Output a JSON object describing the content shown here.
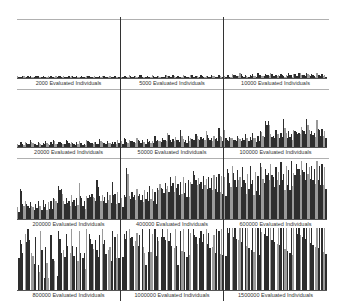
{
  "chart_data": {
    "type": "bar",
    "title": "",
    "layout": "4x3 grid of small-multiple bar plots",
    "grid": false,
    "legend": null,
    "colors": {
      "dark": "#2e2e2e",
      "light": "#9a9a9a",
      "rule": "#b0b0b0",
      "divider": "#333333"
    },
    "panels": [
      {
        "label": "2000 Evaluated Individuals",
        "evaluated": 2000,
        "max_height_frac": 0.04
      },
      {
        "label": "5000 Evaluated Individuals",
        "evaluated": 5000,
        "max_height_frac": 0.06
      },
      {
        "label": "10000 Evaluated Individuals",
        "evaluated": 10000,
        "max_height_frac": 0.09
      },
      {
        "label": "20000 Evaluated Individuals",
        "evaluated": 20000,
        "max_height_frac": 0.14
      },
      {
        "label": "50000 Evaluated Individuals",
        "evaluated": 50000,
        "max_height_frac": 0.33
      },
      {
        "label": "100000 Evaluated Individuals",
        "evaluated": 100000,
        "max_height_frac": 0.5
      },
      {
        "label": "200000 Evaluated Individuals",
        "evaluated": 200000,
        "max_height_frac": 0.65
      },
      {
        "label": "400000 Evaluated Individuals",
        "evaluated": 400000,
        "max_height_frac": 0.85
      },
      {
        "label": "600000 Evaluated Individuals",
        "evaluated": 600000,
        "max_height_frac": 0.97
      },
      {
        "label": "800000 Evaluated Individuals",
        "evaluated": 800000,
        "max_height_frac": 1.0
      },
      {
        "label": "1000000 Evaluated Individuals",
        "evaluated": 1000000,
        "max_height_frac": 1.0
      },
      {
        "label": "1500000 Evaluated Individuals",
        "evaluated": 1500000,
        "max_height_frac": 1.0
      }
    ],
    "series": [
      {
        "name": "2000",
        "values": [
          0.02,
          0.01,
          0.03,
          0.01,
          0.02,
          0.02,
          0.01,
          0.03,
          0.02,
          0.01,
          0.02,
          0.01,
          0.03,
          0.02,
          0.01,
          0.02,
          0.03,
          0.01,
          0.02,
          0.01,
          0.02,
          0.03,
          0.01,
          0.02,
          0.01,
          0.02,
          0.01,
          0.03,
          0.02,
          0.01,
          0.02,
          0.01,
          0.02,
          0.03,
          0.02,
          0.01,
          0.02,
          0.01,
          0.02,
          0.01
        ]
      },
      {
        "name": "5000",
        "values": [
          0.02,
          0.03,
          0.01,
          0.04,
          0.02,
          0.03,
          0.02,
          0.05,
          0.02,
          0.01,
          0.03,
          0.02,
          0.04,
          0.02,
          0.03,
          0.01,
          0.02,
          0.05,
          0.03,
          0.02,
          0.04,
          0.02,
          0.03,
          0.02,
          0.04,
          0.03,
          0.02,
          0.05,
          0.02,
          0.03,
          0.02,
          0.04,
          0.02,
          0.03,
          0.02,
          0.04,
          0.03,
          0.02,
          0.04,
          0.02
        ]
      },
      {
        "name": "10000",
        "values": [
          0.03,
          0.05,
          0.02,
          0.06,
          0.04,
          0.03,
          0.07,
          0.03,
          0.05,
          0.02,
          0.04,
          0.06,
          0.03,
          0.08,
          0.04,
          0.03,
          0.06,
          0.04,
          0.07,
          0.03,
          0.05,
          0.04,
          0.06,
          0.03,
          0.05,
          0.07,
          0.04,
          0.06,
          0.03,
          0.08,
          0.05,
          0.04,
          0.07,
          0.04,
          0.06,
          0.03,
          0.08,
          0.05,
          0.06,
          0.04
        ]
      },
      {
        "name": "20000",
        "values": [
          0.05,
          0.08,
          0.04,
          0.07,
          0.05,
          0.1,
          0.06,
          0.04,
          0.08,
          0.05,
          0.06,
          0.09,
          0.05,
          0.07,
          0.1,
          0.05,
          0.08,
          0.06,
          0.05,
          0.11,
          0.06,
          0.08,
          0.05,
          0.07,
          0.09,
          0.06,
          0.05,
          0.1,
          0.07,
          0.06,
          0.08,
          0.05,
          0.12,
          0.07,
          0.06,
          0.09,
          0.06,
          0.08,
          0.07,
          0.1
        ]
      },
      {
        "name": "50000",
        "values": [
          0.1,
          0.15,
          0.08,
          0.12,
          0.1,
          0.09,
          0.16,
          0.1,
          0.12,
          0.08,
          0.14,
          0.1,
          0.11,
          0.2,
          0.12,
          0.1,
          0.15,
          0.13,
          0.25,
          0.12,
          0.14,
          0.18,
          0.12,
          0.3,
          0.14,
          0.12,
          0.2,
          0.15,
          0.13,
          0.22,
          0.14,
          0.18,
          0.15,
          0.28,
          0.16,
          0.15,
          0.2,
          0.16,
          0.33,
          0.18
        ]
      },
      {
        "name": "100000",
        "values": [
          0.3,
          0.12,
          0.18,
          0.15,
          0.12,
          0.2,
          0.14,
          0.16,
          0.22,
          0.15,
          0.18,
          0.25,
          0.16,
          0.2,
          0.28,
          0.2,
          0.45,
          0.45,
          0.22,
          0.2,
          0.3,
          0.22,
          0.25,
          0.5,
          0.24,
          0.28,
          0.22,
          0.3,
          0.26,
          0.25,
          0.35,
          0.28,
          0.5,
          0.3,
          0.28,
          0.25,
          0.48,
          0.3,
          0.32,
          0.28
        ]
      },
      {
        "name": "200000",
        "values": [
          0.2,
          0.5,
          0.25,
          0.3,
          0.22,
          0.28,
          0.2,
          0.25,
          0.3,
          0.22,
          0.32,
          0.25,
          0.28,
          0.3,
          0.35,
          0.3,
          0.55,
          0.5,
          0.3,
          0.35,
          0.3,
          0.4,
          0.32,
          0.35,
          0.6,
          0.35,
          0.3,
          0.38,
          0.4,
          0.42,
          0.35,
          0.65,
          0.38,
          0.4,
          0.36,
          0.45,
          0.4,
          0.62,
          0.42,
          0.45
        ]
      },
      {
        "name": "400000",
        "values": [
          0.35,
          0.4,
          0.85,
          0.38,
          0.45,
          0.4,
          0.5,
          0.42,
          0.4,
          0.48,
          0.45,
          0.55,
          0.5,
          0.45,
          0.52,
          0.58,
          0.5,
          0.6,
          0.55,
          0.7,
          0.6,
          0.72,
          0.58,
          0.62,
          0.7,
          0.6,
          0.65,
          0.62,
          0.8,
          0.65,
          0.68,
          0.62,
          0.72,
          0.66,
          0.7,
          0.68,
          0.74,
          0.7,
          0.75,
          0.72
        ]
      },
      {
        "name": "600000",
        "values": [
          0.7,
          0.85,
          0.6,
          0.9,
          0.65,
          0.82,
          0.7,
          0.88,
          0.6,
          0.75,
          0.9,
          0.65,
          0.8,
          0.72,
          0.95,
          0.68,
          0.85,
          0.78,
          0.92,
          0.7,
          0.88,
          0.8,
          0.96,
          0.75,
          0.9,
          0.82,
          0.97,
          0.78,
          0.92,
          0.85,
          0.98,
          0.8,
          0.95,
          0.88,
          0.9,
          0.85,
          0.97,
          0.9,
          0.93,
          0.88
        ]
      },
      {
        "name": "800000",
        "values": [
          0.95,
          0.8,
          0.6,
          0.9,
          0.98,
          0.75,
          0.55,
          0.85,
          0.4,
          0.95,
          0.3,
          0.7,
          0.2,
          0.88,
          0.5,
          0.25,
          0.95,
          0.6,
          0.65,
          0.9,
          0.8,
          0.98,
          0.55,
          0.7,
          0.95,
          0.85,
          0.6,
          0.98,
          0.9,
          0.75,
          0.95,
          0.65,
          0.88,
          0.98,
          0.8,
          0.92,
          0.7,
          0.95,
          0.85,
          0.9
        ]
      },
      {
        "name": "1000000",
        "values": [
          0.98,
          0.9,
          0.95,
          0.98,
          0.85,
          0.98,
          0.92,
          0.88,
          0.98,
          0.6,
          0.95,
          0.98,
          0.9,
          0.98,
          0.85,
          0.95,
          0.98,
          0.8,
          0.98,
          0.92,
          0.9,
          0.98,
          0.4,
          0.95,
          0.98,
          0.88,
          0.98,
          0.92,
          0.98,
          0.85,
          0.98,
          0.95,
          0.9,
          0.98,
          0.92,
          0.98,
          0.88,
          0.98,
          0.95,
          0.98
        ]
      },
      {
        "name": "1500000",
        "values": [
          1,
          1,
          1,
          1,
          1,
          1,
          1,
          1,
          1,
          1,
          1,
          1,
          1,
          1,
          1,
          1,
          1,
          1,
          1,
          1,
          1,
          1,
          1,
          1,
          1,
          1,
          1,
          1,
          1,
          1,
          1,
          1,
          1,
          1,
          1,
          1,
          1,
          1,
          1,
          1
        ]
      }
    ],
    "xlabel": "",
    "ylabel": ""
  }
}
